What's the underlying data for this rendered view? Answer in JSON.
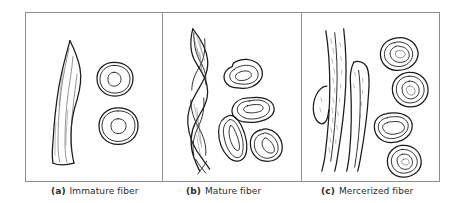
{
  "figure": {
    "border_color": "#8d8d8d",
    "ink_color": "#1a1a1a",
    "background_color": "#ffffff",
    "panel_count": 3
  },
  "panels": [
    {
      "id": "a",
      "tag": "(a)",
      "caption": "Immature fiber",
      "full_caption": "(a)  Immature fiber",
      "longitudinal_description": "Flat ribbon-like collapsed fiber with internal striations",
      "cross_section_count": 2,
      "cross_section_description": "Two rounded oval cross sections with large open lumen and thin wall"
    },
    {
      "id": "b",
      "tag": "(b)",
      "caption": "Mature fiber",
      "full_caption": "(b)  Mature fiber",
      "longitudinal_description": "Twisted convoluted ribbon with reversals and shaded striations",
      "cross_section_count": 4,
      "cross_section_description": "Four kidney / bean shaped cross sections with collapsed slit lumen and thick wall"
    },
    {
      "id": "c",
      "tag": "(c)",
      "caption": "Mercerized fiber",
      "full_caption": "(c)  Mercerized fiber",
      "longitudinal_description": "Swollen untwisted cylindrical fibers with side lobes and stippled surface",
      "cross_section_count": 4,
      "cross_section_description": "Four rounded swollen cross sections with thick layered wall and small lumen"
    }
  ],
  "captions": {
    "a_tag": "(a)",
    "a_text": "Immature fiber",
    "b_tag": "(b)",
    "b_text": "Mature fiber",
    "c_tag": "(c)",
    "c_text": "Mercerized fiber"
  }
}
